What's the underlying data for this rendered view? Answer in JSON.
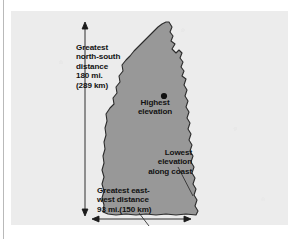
{
  "figure": {
    "colors": {
      "page_background": "#ffffff",
      "panel_background": "#ececec",
      "state_fill": "#989898",
      "state_outline": "#2b2b2b",
      "arrow_color": "#1b1b1b",
      "text_color": "#121212",
      "gutter_rule": "#b9b9b9"
    },
    "labels": {
      "north_south": "Greatest\nnorth-south\ndistance\n180 mi.\n(289 km)",
      "highest_elevation": "Highest\nelevation",
      "lowest_elevation": "Lowest\nelevation\nalong coast",
      "east_west": "Greatest east-\nwest distance\n93 mi.(150 km)"
    },
    "measurements": {
      "north_south_miles": "180 mi.",
      "north_south_km": "(289 km)",
      "east_west_miles": "93 mi.",
      "east_west_km": "(150 km)"
    },
    "markers": {
      "highest_elevation_point": "dot-marker",
      "vertical_arrow": "double-headed-arrow-vertical",
      "horizontal_arrow": "double-headed-arrow-horizontal"
    }
  }
}
